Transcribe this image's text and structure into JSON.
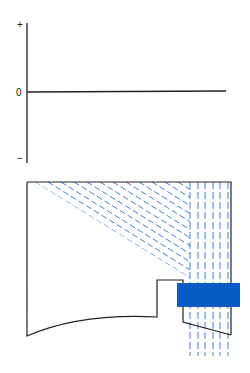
{
  "graph": {
    "labels": {
      "plus": "+",
      "zero": "0",
      "minus": "−"
    },
    "axis_color": "#222222"
  },
  "figure": {
    "outline_color": "#222222",
    "hatch_color": "#2c6fcf",
    "block_color": "#0a5bc4",
    "vertical_dashed_line_count": 6,
    "diagonal_dashed_line_count": 11
  }
}
